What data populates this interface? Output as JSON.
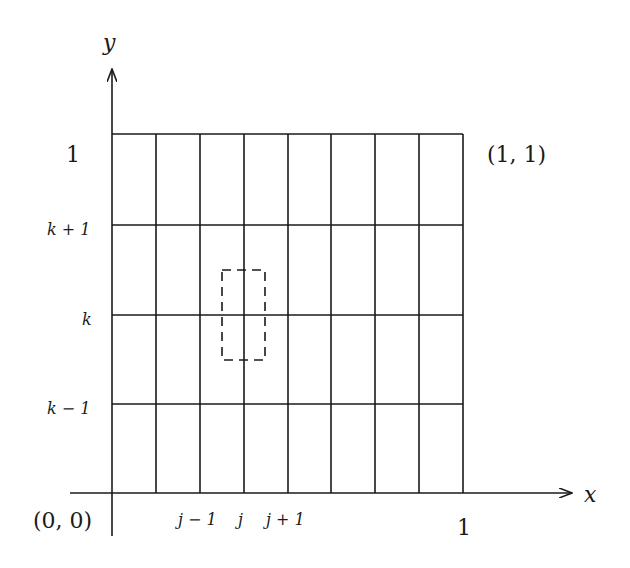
{
  "diagram": {
    "type": "finite-difference-grid",
    "axes": {
      "x_label": "x",
      "y_label": "y",
      "origin_label": "(0, 0)",
      "corner_label": "(1, 1)",
      "x_end_label": "1",
      "y_end_label": "1"
    },
    "grid": {
      "columns": 8,
      "rows": 4,
      "line_color": "#1a1a1a"
    },
    "y_tick_labels": [
      "k + 1",
      "k",
      "k − 1"
    ],
    "x_tick_labels": [
      "j − 1",
      "j",
      "j + 1"
    ],
    "stencil_box": {
      "style": "dashed",
      "center": "(j, k)"
    }
  }
}
